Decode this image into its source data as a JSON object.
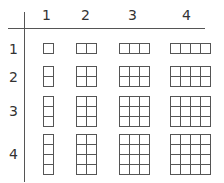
{
  "diagram": {
    "column_headers": [
      "1",
      "2",
      "3",
      "4"
    ],
    "row_headers": [
      "1",
      "2",
      "3",
      "4"
    ],
    "line_color": "#555555",
    "cells": [
      {
        "row": 1,
        "col": 1,
        "rows": 1,
        "cols": 1
      },
      {
        "row": 1,
        "col": 2,
        "rows": 1,
        "cols": 2
      },
      {
        "row": 1,
        "col": 3,
        "rows": 1,
        "cols": 3
      },
      {
        "row": 1,
        "col": 4,
        "rows": 1,
        "cols": 4
      },
      {
        "row": 2,
        "col": 1,
        "rows": 2,
        "cols": 1
      },
      {
        "row": 2,
        "col": 2,
        "rows": 2,
        "cols": 2
      },
      {
        "row": 2,
        "col": 3,
        "rows": 2,
        "cols": 3
      },
      {
        "row": 2,
        "col": 4,
        "rows": 2,
        "cols": 4
      },
      {
        "row": 3,
        "col": 1,
        "rows": 3,
        "cols": 1
      },
      {
        "row": 3,
        "col": 2,
        "rows": 3,
        "cols": 2
      },
      {
        "row": 3,
        "col": 3,
        "rows": 3,
        "cols": 3
      },
      {
        "row": 3,
        "col": 4,
        "rows": 3,
        "cols": 4
      },
      {
        "row": 4,
        "col": 1,
        "rows": 4,
        "cols": 1
      },
      {
        "row": 4,
        "col": 2,
        "rows": 4,
        "cols": 2
      },
      {
        "row": 4,
        "col": 3,
        "rows": 4,
        "cols": 3
      },
      {
        "row": 4,
        "col": 4,
        "rows": 4,
        "cols": 4
      }
    ]
  }
}
